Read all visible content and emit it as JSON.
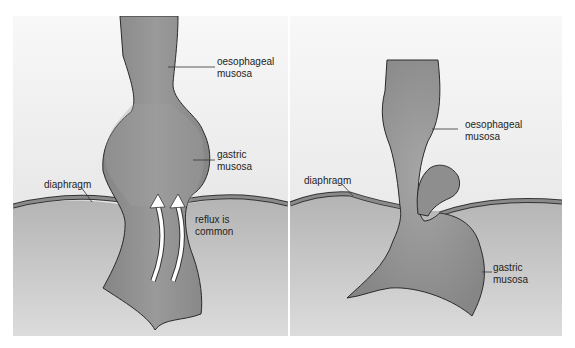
{
  "figure": {
    "panels": [
      {
        "id": "left",
        "depicts": "sliding hiatus hernia",
        "labels": {
          "oesophageal": "oesophageal\nmusosa",
          "gastric": "gastric\nmusosa",
          "diaphragm": "diaphragm",
          "reflux": "reflux is\ncommon"
        }
      },
      {
        "id": "right",
        "depicts": "rolling (para-oesophageal) hiatus hernia",
        "labels": {
          "oesophageal": "oesophageal\nmusosa",
          "gastric": "gastric\nmusosa",
          "diaphragm": "diaphragm"
        }
      }
    ],
    "colors": {
      "background_top": "#f7f7f7",
      "background_bottom": "#d9d9d9",
      "abdomen": "#bdbdbd",
      "organ": "#8f8f8f",
      "organ_light": "#a8a8a8",
      "outline": "#2a2a2a",
      "diaphragm_band": "#8a8a8a",
      "arrow": "#ffffff"
    }
  }
}
